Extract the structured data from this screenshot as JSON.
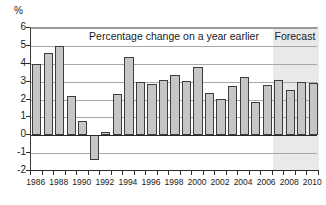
{
  "chart_data": {
    "type": "bar",
    "title": "Percentage change on a year earlier",
    "xlabel": "",
    "ylabel": "%",
    "ylim": [
      -2,
      6
    ],
    "ytick_values": [
      6,
      5,
      4,
      3,
      2,
      1,
      0,
      -1,
      -2
    ],
    "ytick_labels": [
      "6",
      "5",
      "4",
      "3",
      "2",
      "1",
      "0",
      "-1",
      "-2"
    ],
    "grid": true,
    "legend": "none",
    "categories": [
      "1986",
      "1987",
      "1988",
      "1989",
      "1990",
      "1991",
      "1992",
      "1993",
      "1994",
      "1995",
      "1996",
      "1997",
      "1998",
      "1999",
      "2000",
      "2001",
      "2002",
      "2003",
      "2004",
      "2005",
      "2006",
      "2007",
      "2008",
      "2009",
      "2010"
    ],
    "values": [
      4.0,
      4.6,
      5.0,
      2.2,
      0.8,
      -1.4,
      0.2,
      2.3,
      4.35,
      3.0,
      2.85,
      3.1,
      3.35,
      3.05,
      3.8,
      2.35,
      2.05,
      2.75,
      3.25,
      1.85,
      2.8,
      3.1,
      2.55,
      3.0,
      2.95
    ],
    "xtick_labels": [
      "1986",
      "1988",
      "1990",
      "1992",
      "1994",
      "1996",
      "1998",
      "2000",
      "2002",
      "2004",
      "2006",
      "2008",
      "2010"
    ],
    "annotations": [
      {
        "name": "forecast",
        "text": "Forecast",
        "start_category": "2007"
      }
    ],
    "forecast_start_category": "2007",
    "bar_fill_color": "#c6c6c6",
    "bar_edge_color": "#3d3d3d",
    "forecast_band_color": "#e9e9e9",
    "gridline_color": "#a8a8a8",
    "axis_color": "#2a2a2a"
  }
}
